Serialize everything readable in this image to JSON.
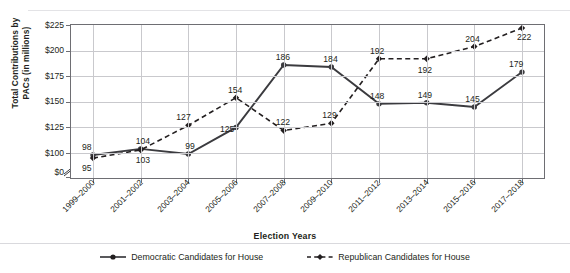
{
  "chart_data": {
    "type": "line",
    "title": "",
    "xlabel": "Election Years",
    "ylabel": "Total Contributions by PACs (in millions)",
    "ylabel_line1": "Total Contributions by",
    "ylabel_line2": "PACs (in millions)",
    "categories": [
      "1999–2000",
      "2001–2002",
      "2003–2004",
      "2005–2006",
      "2007–2008",
      "2009–2010",
      "2011–2012",
      "2013–2014",
      "2015–2016",
      "2017–2018"
    ],
    "yticks": [
      "$0",
      "$100",
      "$125",
      "$150",
      "$175",
      "$200",
      "$225"
    ],
    "ylim": [
      100,
      225
    ],
    "y_axis_break": true,
    "y_axis_break_between": [
      "$0",
      "$100"
    ],
    "grid": true,
    "legend_position": "bottom",
    "series": [
      {
        "name": "Democratic Candidates for House",
        "style": "solid",
        "marker": "circle",
        "color": "#3b3b3f",
        "values": [
          98,
          104,
          99,
          125,
          186,
          184,
          148,
          149,
          145,
          179
        ],
        "label_positions": [
          "above",
          "above",
          "above",
          "above",
          "above",
          "above",
          "above",
          "above",
          "above",
          "above"
        ]
      },
      {
        "name": "Republican Candidates for House",
        "style": "dashed",
        "marker": "diamond",
        "color": "#231f20",
        "values": [
          95,
          103,
          127,
          154,
          122,
          129,
          192,
          192,
          204,
          222
        ],
        "label_positions": [
          "below",
          "below",
          "above",
          "above",
          "above",
          "above",
          "above",
          "below",
          "above",
          "below"
        ]
      }
    ]
  },
  "legend": {
    "items": [
      {
        "label": "Democratic Candidates for House"
      },
      {
        "label": "Republican Candidates for House"
      }
    ]
  },
  "axes": {
    "x_title": "Election Years",
    "y_title_line1": "Total Contributions by",
    "y_title_line2": "PACs (in millions)"
  }
}
